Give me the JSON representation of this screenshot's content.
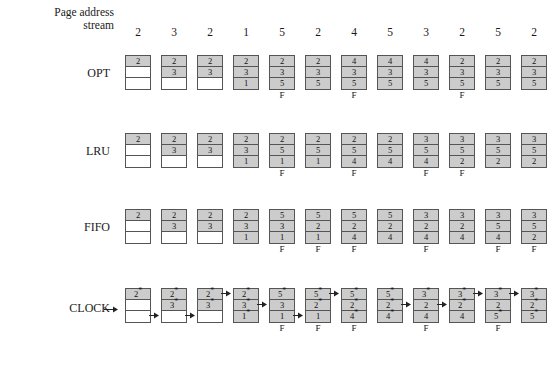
{
  "figure": {
    "stream_label_line1": "Page address",
    "stream_label_line2": "stream",
    "fault_marker": "F",
    "star": "*",
    "empty": "",
    "colors": {
      "filled_cell": "#cccccc",
      "empty_cell": "#ffffff",
      "border": "#555555",
      "text": "#111111",
      "background": "#ffffff"
    }
  },
  "page_address_stream": [
    "2",
    "3",
    "2",
    "1",
    "5",
    "2",
    "4",
    "5",
    "3",
    "2",
    "5",
    "2"
  ],
  "algorithms": [
    {
      "name": "OPT",
      "has_pointer_arrow": false,
      "columns": [
        {
          "cells": [
            "2",
            "",
            ""
          ],
          "stars": [
            false,
            false,
            false
          ],
          "fault": false,
          "arrow_row": 0
        },
        {
          "cells": [
            "2",
            "3",
            ""
          ],
          "stars": [
            false,
            false,
            false
          ],
          "fault": false,
          "arrow_row": 0
        },
        {
          "cells": [
            "2",
            "3",
            ""
          ],
          "stars": [
            false,
            false,
            false
          ],
          "fault": false,
          "arrow_row": 0
        },
        {
          "cells": [
            "2",
            "3",
            "1"
          ],
          "stars": [
            false,
            false,
            false
          ],
          "fault": false,
          "arrow_row": 0
        },
        {
          "cells": [
            "2",
            "3",
            "5"
          ],
          "stars": [
            false,
            false,
            false
          ],
          "fault": true,
          "arrow_row": 0
        },
        {
          "cells": [
            "2",
            "3",
            "5"
          ],
          "stars": [
            false,
            false,
            false
          ],
          "fault": false,
          "arrow_row": 0
        },
        {
          "cells": [
            "4",
            "3",
            "5"
          ],
          "stars": [
            false,
            false,
            false
          ],
          "fault": true,
          "arrow_row": 0
        },
        {
          "cells": [
            "4",
            "3",
            "5"
          ],
          "stars": [
            false,
            false,
            false
          ],
          "fault": false,
          "arrow_row": 0
        },
        {
          "cells": [
            "4",
            "3",
            "5"
          ],
          "stars": [
            false,
            false,
            false
          ],
          "fault": false,
          "arrow_row": 0
        },
        {
          "cells": [
            "2",
            "3",
            "5"
          ],
          "stars": [
            false,
            false,
            false
          ],
          "fault": true,
          "arrow_row": 0
        },
        {
          "cells": [
            "2",
            "3",
            "5"
          ],
          "stars": [
            false,
            false,
            false
          ],
          "fault": false,
          "arrow_row": 0
        },
        {
          "cells": [
            "2",
            "3",
            "5"
          ],
          "stars": [
            false,
            false,
            false
          ],
          "fault": false,
          "arrow_row": 0
        }
      ]
    },
    {
      "name": "LRU",
      "has_pointer_arrow": false,
      "columns": [
        {
          "cells": [
            "2",
            "",
            ""
          ],
          "stars": [
            false,
            false,
            false
          ],
          "fault": false,
          "arrow_row": 0
        },
        {
          "cells": [
            "2",
            "3",
            ""
          ],
          "stars": [
            false,
            false,
            false
          ],
          "fault": false,
          "arrow_row": 0
        },
        {
          "cells": [
            "2",
            "3",
            ""
          ],
          "stars": [
            false,
            false,
            false
          ],
          "fault": false,
          "arrow_row": 0
        },
        {
          "cells": [
            "2",
            "3",
            "1"
          ],
          "stars": [
            false,
            false,
            false
          ],
          "fault": false,
          "arrow_row": 0
        },
        {
          "cells": [
            "2",
            "5",
            "1"
          ],
          "stars": [
            false,
            false,
            false
          ],
          "fault": true,
          "arrow_row": 0
        },
        {
          "cells": [
            "2",
            "5",
            "1"
          ],
          "stars": [
            false,
            false,
            false
          ],
          "fault": false,
          "arrow_row": 0
        },
        {
          "cells": [
            "2",
            "5",
            "4"
          ],
          "stars": [
            false,
            false,
            false
          ],
          "fault": true,
          "arrow_row": 0
        },
        {
          "cells": [
            "2",
            "5",
            "4"
          ],
          "stars": [
            false,
            false,
            false
          ],
          "fault": false,
          "arrow_row": 0
        },
        {
          "cells": [
            "3",
            "5",
            "4"
          ],
          "stars": [
            false,
            false,
            false
          ],
          "fault": true,
          "arrow_row": 0
        },
        {
          "cells": [
            "3",
            "5",
            "2"
          ],
          "stars": [
            false,
            false,
            false
          ],
          "fault": true,
          "arrow_row": 0
        },
        {
          "cells": [
            "3",
            "5",
            "2"
          ],
          "stars": [
            false,
            false,
            false
          ],
          "fault": false,
          "arrow_row": 0
        },
        {
          "cells": [
            "3",
            "5",
            "2"
          ],
          "stars": [
            false,
            false,
            false
          ],
          "fault": false,
          "arrow_row": 0
        }
      ]
    },
    {
      "name": "FIFO",
      "has_pointer_arrow": false,
      "columns": [
        {
          "cells": [
            "2",
            "",
            ""
          ],
          "stars": [
            false,
            false,
            false
          ],
          "fault": false,
          "arrow_row": 0
        },
        {
          "cells": [
            "2",
            "3",
            ""
          ],
          "stars": [
            false,
            false,
            false
          ],
          "fault": false,
          "arrow_row": 0
        },
        {
          "cells": [
            "2",
            "3",
            ""
          ],
          "stars": [
            false,
            false,
            false
          ],
          "fault": false,
          "arrow_row": 0
        },
        {
          "cells": [
            "2",
            "3",
            "1"
          ],
          "stars": [
            false,
            false,
            false
          ],
          "fault": false,
          "arrow_row": 0
        },
        {
          "cells": [
            "5",
            "3",
            "1"
          ],
          "stars": [
            false,
            false,
            false
          ],
          "fault": true,
          "arrow_row": 0
        },
        {
          "cells": [
            "5",
            "2",
            "1"
          ],
          "stars": [
            false,
            false,
            false
          ],
          "fault": true,
          "arrow_row": 0
        },
        {
          "cells": [
            "5",
            "2",
            "4"
          ],
          "stars": [
            false,
            false,
            false
          ],
          "fault": true,
          "arrow_row": 0
        },
        {
          "cells": [
            "5",
            "2",
            "4"
          ],
          "stars": [
            false,
            false,
            false
          ],
          "fault": false,
          "arrow_row": 0
        },
        {
          "cells": [
            "3",
            "2",
            "4"
          ],
          "stars": [
            false,
            false,
            false
          ],
          "fault": true,
          "arrow_row": 0
        },
        {
          "cells": [
            "3",
            "2",
            "4"
          ],
          "stars": [
            false,
            false,
            false
          ],
          "fault": false,
          "arrow_row": 0
        },
        {
          "cells": [
            "3",
            "5",
            "4"
          ],
          "stars": [
            false,
            false,
            false
          ],
          "fault": true,
          "arrow_row": 0
        },
        {
          "cells": [
            "3",
            "5",
            "2"
          ],
          "stars": [
            false,
            false,
            false
          ],
          "fault": true,
          "arrow_row": 0
        }
      ]
    },
    {
      "name": "CLOCK",
      "has_pointer_arrow": true,
      "columns": [
        {
          "cells": [
            "2",
            "",
            ""
          ],
          "stars": [
            true,
            false,
            false
          ],
          "fault": false,
          "arrow_row": 3
        },
        {
          "cells": [
            "2",
            "3",
            ""
          ],
          "stars": [
            true,
            true,
            false
          ],
          "fault": false,
          "arrow_row": 3
        },
        {
          "cells": [
            "2",
            "3",
            ""
          ],
          "stars": [
            true,
            true,
            false
          ],
          "fault": false,
          "arrow_row": 1
        },
        {
          "cells": [
            "2",
            "3",
            "1"
          ],
          "stars": [
            true,
            true,
            true
          ],
          "fault": false,
          "arrow_row": 2
        },
        {
          "cells": [
            "5",
            "3",
            "1"
          ],
          "stars": [
            true,
            false,
            false
          ],
          "fault": true,
          "arrow_row": 3
        },
        {
          "cells": [
            "5",
            "2",
            "1"
          ],
          "stars": [
            true,
            true,
            false
          ],
          "fault": true,
          "arrow_row": 1
        },
        {
          "cells": [
            "5",
            "2",
            "4"
          ],
          "stars": [
            true,
            true,
            true
          ],
          "fault": true,
          "arrow_row": 0
        },
        {
          "cells": [
            "5",
            "2",
            "4"
          ],
          "stars": [
            true,
            true,
            true
          ],
          "fault": false,
          "arrow_row": 2
        },
        {
          "cells": [
            "3",
            "2",
            "4"
          ],
          "stars": [
            true,
            false,
            false
          ],
          "fault": true,
          "arrow_row": 2
        },
        {
          "cells": [
            "3",
            "2",
            "4"
          ],
          "stars": [
            true,
            true,
            false
          ],
          "fault": false,
          "arrow_row": 1
        },
        {
          "cells": [
            "3",
            "2",
            "5"
          ],
          "stars": [
            true,
            false,
            true
          ],
          "fault": true,
          "arrow_row": 1
        },
        {
          "cells": [
            "3",
            "2",
            "5"
          ],
          "stars": [
            true,
            true,
            true
          ],
          "fault": false,
          "arrow_row": 0
        }
      ]
    }
  ]
}
